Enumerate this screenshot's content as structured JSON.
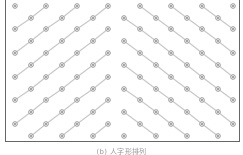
{
  "figure": {
    "caption": "(b) 人字形排列",
    "colors": {
      "frame": "#666666",
      "line": "#c8c8c8",
      "node_ring": "#8a8a8a",
      "node_center": "#333333",
      "background": "#ffffff"
    },
    "grid": {
      "row_y": [
        6,
        18,
        29,
        41,
        53,
        65,
        77,
        89,
        100,
        112,
        124,
        136
      ],
      "odd_row_x": [
        15,
        46,
        77,
        108,
        140,
        171,
        202,
        233
      ],
      "even_row_x": [
        31,
        62,
        93,
        124,
        156,
        187,
        218
      ],
      "apex_x": 124,
      "left_direction": "up-right",
      "right_direction": "down-right"
    }
  }
}
